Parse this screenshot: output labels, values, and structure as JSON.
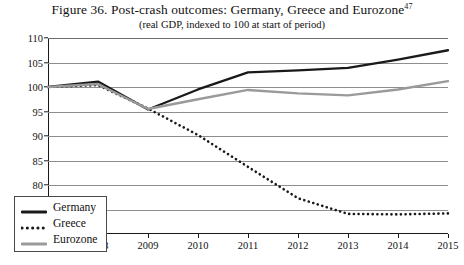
{
  "chart_data": {
    "type": "line",
    "title": "Figure 36. Post-crash outcomes: Germany, Greece and Eurozone",
    "title_footnote": "47",
    "subtitle": "(real GDP, indexed to 100 at start of period)",
    "xlabel": "",
    "ylabel": "",
    "x": [
      2007,
      2008,
      2009,
      2010,
      2011,
      2012,
      2013,
      2014,
      2015
    ],
    "categories": [
      "2007",
      "2008",
      "2009",
      "2010",
      "2011",
      "2012",
      "2013",
      "2014",
      "2015"
    ],
    "xlim": [
      2007,
      2015
    ],
    "ylim": [
      70,
      110
    ],
    "yticks": [
      70,
      75,
      80,
      85,
      90,
      95,
      100,
      105,
      110
    ],
    "ytick_labels": [
      "70",
      "75",
      "80",
      "85",
      "90",
      "95",
      "100",
      "105",
      "110"
    ],
    "grid": true,
    "legend_position": "bottom-left",
    "series": [
      {
        "name": "Germany",
        "style": "solid",
        "color": "#1a1a1a",
        "values": [
          100.0,
          101.1,
          95.4,
          99.5,
          103.0,
          103.4,
          103.9,
          105.6,
          107.5
        ]
      },
      {
        "name": "Greece",
        "style": "dotted",
        "color": "#1a1a1a",
        "values": [
          100.0,
          100.4,
          95.6,
          90.2,
          83.7,
          77.3,
          74.1,
          74.0,
          74.2
        ]
      },
      {
        "name": "Eurozone",
        "style": "solid",
        "color": "#9a9a9a",
        "values": [
          100.0,
          100.6,
          95.5,
          97.5,
          99.4,
          98.7,
          98.3,
          99.5,
          101.2
        ]
      }
    ]
  }
}
